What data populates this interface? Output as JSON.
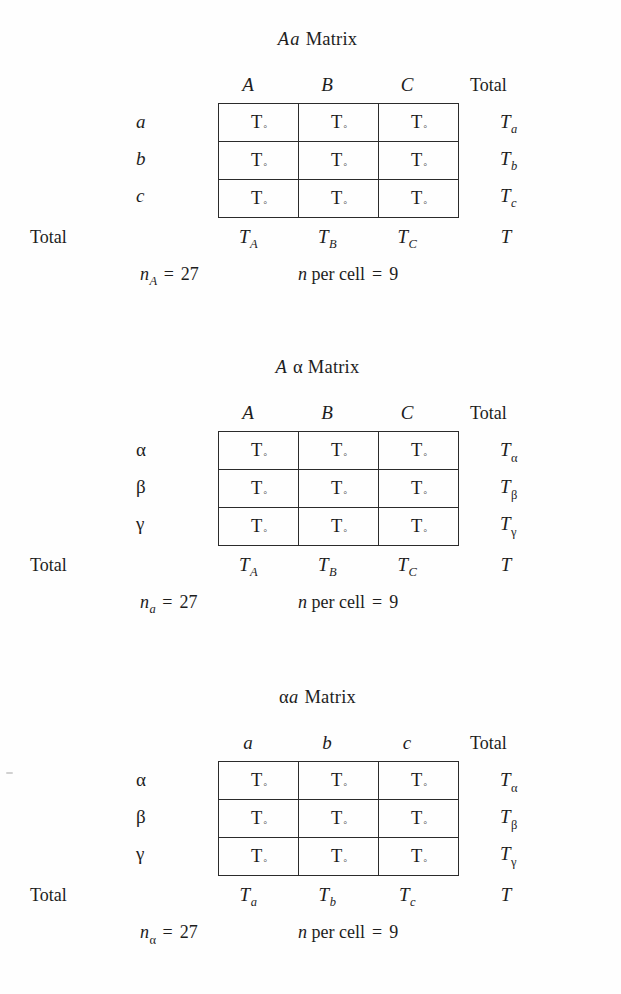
{
  "page": {
    "background": "#ffffff",
    "ink": "#1d1d1d",
    "rule_color": "#2b2b2b"
  },
  "common": {
    "total_label": "Total",
    "cell_value": {
      "symbol": "T",
      "subscript": "◦"
    },
    "grand_total": "T",
    "equals": "=",
    "per_cell_label": "per cell",
    "n_symbol": "n"
  },
  "matrices": [
    {
      "id": "aa-matrix",
      "title": {
        "sym1": "A",
        "sym2": "a",
        "sym1_style": "italic-latin",
        "sym2_style": "italic-latin",
        "word": "Matrix"
      },
      "col_headers": [
        "A",
        "B",
        "C"
      ],
      "col_header_style": "italic-latin",
      "row_headers": [
        "a",
        "b",
        "c"
      ],
      "row_header_style": "italic-latin",
      "corner_total_label": "Total",
      "row_totals": [
        {
          "base": "T",
          "sub": "a",
          "sub_style": "latin"
        },
        {
          "base": "T",
          "sub": "b",
          "sub_style": "latin"
        },
        {
          "base": "T",
          "sub": "c",
          "sub_style": "latin"
        }
      ],
      "col_totals": [
        {
          "base": "T",
          "sub": "A",
          "sub_style": "latin"
        },
        {
          "base": "T",
          "sub": "B",
          "sub_style": "latin"
        },
        {
          "base": "T",
          "sub": "C",
          "sub_style": "latin"
        }
      ],
      "grand_total": "T",
      "cells": [
        [
          "T◦",
          "T◦",
          "T◦"
        ],
        [
          "T◦",
          "T◦",
          "T◦"
        ],
        [
          "T◦",
          "T◦",
          "T◦"
        ]
      ],
      "footnote": {
        "n_base": "n",
        "n_sub": "A",
        "n_sub_style": "latin",
        "n_value": "27",
        "per_cell_text": "per cell",
        "per_cell_value": "9"
      }
    },
    {
      "id": "a-alpha-matrix",
      "title": {
        "sym1": "A",
        "sym2": "α",
        "sym1_style": "italic-latin",
        "sym2_style": "greek",
        "word": "Matrix"
      },
      "col_headers": [
        "A",
        "B",
        "C"
      ],
      "col_header_style": "italic-latin",
      "row_headers": [
        "α",
        "β",
        "γ"
      ],
      "row_header_style": "greek",
      "corner_total_label": "Total",
      "row_totals": [
        {
          "base": "T",
          "sub": "α",
          "sub_style": "greek"
        },
        {
          "base": "T",
          "sub": "β",
          "sub_style": "greek"
        },
        {
          "base": "T",
          "sub": "γ",
          "sub_style": "greek"
        }
      ],
      "col_totals": [
        {
          "base": "T",
          "sub": "A",
          "sub_style": "latin"
        },
        {
          "base": "T",
          "sub": "B",
          "sub_style": "latin"
        },
        {
          "base": "T",
          "sub": "C",
          "sub_style": "latin"
        }
      ],
      "grand_total": "T",
      "cells": [
        [
          "T◦",
          "T◦",
          "T◦"
        ],
        [
          "T◦",
          "T◦",
          "T◦"
        ],
        [
          "T◦",
          "T◦",
          "T◦"
        ]
      ],
      "footnote": {
        "n_base": "n",
        "n_sub": "a",
        "n_sub_style": "latin",
        "n_value": "27",
        "per_cell_text": "per cell",
        "per_cell_value": "9"
      }
    },
    {
      "id": "alpha-a-matrix",
      "title": {
        "sym1": "α",
        "sym2": "a",
        "sym1_style": "greek",
        "sym2_style": "italic-latin",
        "word": "Matrix"
      },
      "col_headers": [
        "a",
        "b",
        "c"
      ],
      "col_header_style": "italic-latin",
      "row_headers": [
        "α",
        "β",
        "γ"
      ],
      "row_header_style": "greek",
      "corner_total_label": "Total",
      "row_totals": [
        {
          "base": "T",
          "sub": "α",
          "sub_style": "greek"
        },
        {
          "base": "T",
          "sub": "β",
          "sub_style": "greek"
        },
        {
          "base": "T",
          "sub": "γ",
          "sub_style": "greek"
        }
      ],
      "col_totals": [
        {
          "base": "T",
          "sub": "a",
          "sub_style": "latin"
        },
        {
          "base": "T",
          "sub": "b",
          "sub_style": "latin"
        },
        {
          "base": "T",
          "sub": "c",
          "sub_style": "latin"
        }
      ],
      "grand_total": "T",
      "cells": [
        [
          "T◦",
          "T◦",
          "T◦"
        ],
        [
          "T◦",
          "T◦",
          "T◦"
        ],
        [
          "T◦",
          "T◦",
          "T◦"
        ]
      ],
      "footnote": {
        "n_base": "n",
        "n_sub": "α",
        "n_sub_style": "greek",
        "n_value": "27",
        "per_cell_text": "per cell",
        "per_cell_value": "9"
      }
    }
  ]
}
